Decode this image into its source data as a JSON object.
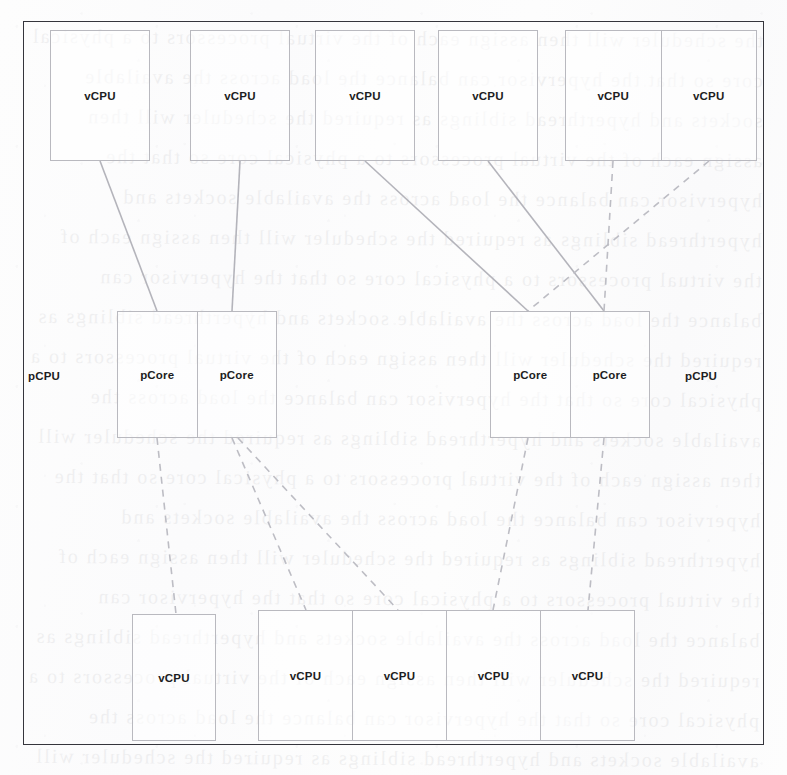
{
  "diagram": {
    "labels": {
      "vcpu": "vCPU",
      "pcore": "pCore",
      "pcpu": "pCPU"
    },
    "ghost_text": "the scheduler will then assign each of the virtual processors to a physical core so that the hypervisor can balance the load across the available sockets and hyperthread siblings as required",
    "colors": {
      "frame_border": "#35353c",
      "box_border": "#b9b9bf",
      "solid_edge": "#b4b4bb",
      "dashed_edge": "#bdbdc4",
      "text": "#1d1d22",
      "page_background": "#fdfdfd"
    },
    "top_row": {
      "name": "top-vcpu-row",
      "items": [
        {
          "id": "vcpu-t1",
          "label": "vCPU",
          "grouped": false
        },
        {
          "id": "vcpu-t2",
          "label": "vCPU",
          "grouped": false
        },
        {
          "id": "vcpu-t3",
          "label": "vCPU",
          "grouped": false
        },
        {
          "id": "vcpu-t4",
          "label": "vCPU",
          "grouped": false
        },
        {
          "id": "vcpu-t5",
          "label": "vCPU",
          "grouped": true
        },
        {
          "id": "vcpu-t6",
          "label": "vCPU",
          "grouped": true
        }
      ]
    },
    "middle_row": {
      "name": "pcpu-row",
      "pcpus": [
        {
          "id": "pcpu-left",
          "label": "pCPU",
          "label_side": "left",
          "cores": [
            {
              "id": "pcore-l1",
              "label": "pCore"
            },
            {
              "id": "pcore-l2",
              "label": "pCore"
            }
          ]
        },
        {
          "id": "pcpu-right",
          "label": "pCPU",
          "label_side": "right",
          "cores": [
            {
              "id": "pcore-r1",
              "label": "pCore"
            },
            {
              "id": "pcore-r2",
              "label": "pCore"
            }
          ]
        }
      ]
    },
    "bottom_row": {
      "name": "bottom-vcpu-row",
      "items": [
        {
          "id": "vcpu-b1",
          "label": "vCPU",
          "grouped": false
        },
        {
          "id": "vcpu-b2",
          "label": "vCPU",
          "grouped": true
        },
        {
          "id": "vcpu-b3",
          "label": "vCPU",
          "grouped": true
        },
        {
          "id": "vcpu-b4",
          "label": "vCPU",
          "grouped": true
        },
        {
          "id": "vcpu-b5",
          "label": "vCPU",
          "grouped": true
        }
      ]
    },
    "edges": [
      {
        "id": "edge-t1-l1",
        "from": "vcpu-t1",
        "to": "pcore-l1",
        "style": "solid"
      },
      {
        "id": "edge-t2-l2",
        "from": "vcpu-t2",
        "to": "pcore-l2",
        "style": "solid"
      },
      {
        "id": "edge-t3-r1",
        "from": "vcpu-t3",
        "to": "pcore-r1",
        "style": "solid"
      },
      {
        "id": "edge-t4-r2",
        "from": "vcpu-t4",
        "to": "pcore-r2",
        "style": "solid"
      },
      {
        "id": "edge-t5-r2",
        "from": "vcpu-t5",
        "to": "pcore-r2",
        "style": "dashed"
      },
      {
        "id": "edge-t6-r1",
        "from": "vcpu-t6",
        "to": "pcore-r1",
        "style": "dashed"
      },
      {
        "id": "edge-l1-b1",
        "from": "pcore-l1",
        "to": "vcpu-b1",
        "style": "dashed"
      },
      {
        "id": "edge-l2-b2",
        "from": "pcore-l2",
        "to": "vcpu-b2",
        "style": "dashed"
      },
      {
        "id": "edge-l2-b3",
        "from": "pcore-l2",
        "to": "vcpu-b3",
        "style": "dashed"
      },
      {
        "id": "edge-r1-b4",
        "from": "pcore-r1",
        "to": "vcpu-b4",
        "style": "dashed"
      },
      {
        "id": "edge-r2-b5",
        "from": "pcore-r2",
        "to": "vcpu-b5",
        "style": "dashed"
      }
    ]
  }
}
